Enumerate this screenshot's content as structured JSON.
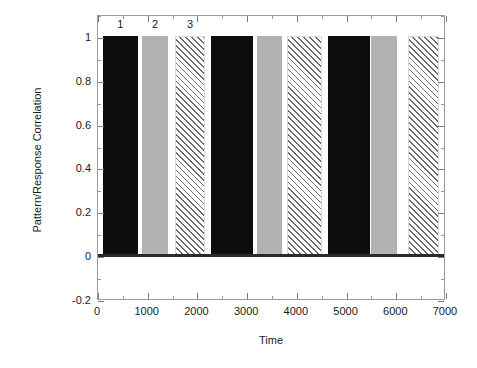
{
  "chart_data": {
    "type": "bar",
    "title": "",
    "xlabel": "Time",
    "ylabel": "Pattern/Response Correlation",
    "xlim": [
      0,
      7000
    ],
    "ylim": [
      -0.2,
      1.1
    ],
    "grid": false,
    "legend": "none",
    "xticks": [
      0,
      1000,
      2000,
      3000,
      4000,
      5000,
      6000,
      7000
    ],
    "xtick_labels": [
      "0",
      "1000",
      "2000",
      "3000",
      "4000",
      "5000",
      "6000",
      "7000"
    ],
    "yticks": [
      -0.2,
      0,
      0.2,
      0.4,
      0.6,
      0.8,
      1
    ],
    "ytick_labels": [
      "-0.2",
      "0",
      "0.2",
      "0.4",
      "0.6",
      "0.8",
      "1"
    ],
    "x": [
      450,
      1150,
      1850,
      2700,
      3450,
      4150,
      5050,
      5750,
      6550
    ],
    "values": [
      1,
      1,
      1,
      1,
      1,
      1,
      1,
      1,
      1
    ],
    "bar_width": [
      700,
      520,
      620,
      850,
      520,
      700,
      850,
      520,
      620
    ],
    "bars": [
      {
        "x_center": 450,
        "x_start": 100,
        "x_end": 800,
        "value": 1,
        "style": "solid-black",
        "annotation": "1"
      },
      {
        "x_center": 1150,
        "x_start": 890,
        "x_end": 1410,
        "value": 1,
        "style": "solid-gray",
        "annotation": "2"
      },
      {
        "x_center": 1850,
        "x_start": 1540,
        "x_end": 2160,
        "value": 1,
        "style": "hatch",
        "annotation": "3"
      },
      {
        "x_center": 2700,
        "x_start": 2275,
        "x_end": 3125,
        "value": 1,
        "style": "solid-black",
        "annotation": ""
      },
      {
        "x_center": 3450,
        "x_start": 3190,
        "x_end": 3710,
        "value": 1,
        "style": "solid-gray",
        "annotation": ""
      },
      {
        "x_center": 4150,
        "x_start": 3800,
        "x_end": 4500,
        "value": 1,
        "style": "hatch",
        "annotation": ""
      },
      {
        "x_center": 5050,
        "x_start": 4625,
        "x_end": 5475,
        "value": 1,
        "style": "solid-black",
        "annotation": ""
      },
      {
        "x_center": 5750,
        "x_start": 5490,
        "x_end": 6010,
        "value": 1,
        "style": "solid-gray",
        "annotation": ""
      },
      {
        "x_center": 6550,
        "x_start": 6240,
        "x_end": 6860,
        "value": 1,
        "style": "hatch",
        "annotation": ""
      }
    ],
    "annotations": [
      {
        "text": "1",
        "x": 450,
        "y": 1.06
      },
      {
        "text": "2",
        "x": 1150,
        "y": 1.06
      },
      {
        "text": "3",
        "x": 1850,
        "y": 1.06
      }
    ],
    "colors": {
      "solid_black": "#0d0d0d",
      "solid_gray": "#b2b2b2",
      "hatch_line": "#6e6e6e",
      "hatch_fill": "#ffffff",
      "axis": "#9a9a9a",
      "zero_line": "#2b2b2b",
      "text": "#1a1a1a",
      "background": "#ffffff"
    }
  }
}
